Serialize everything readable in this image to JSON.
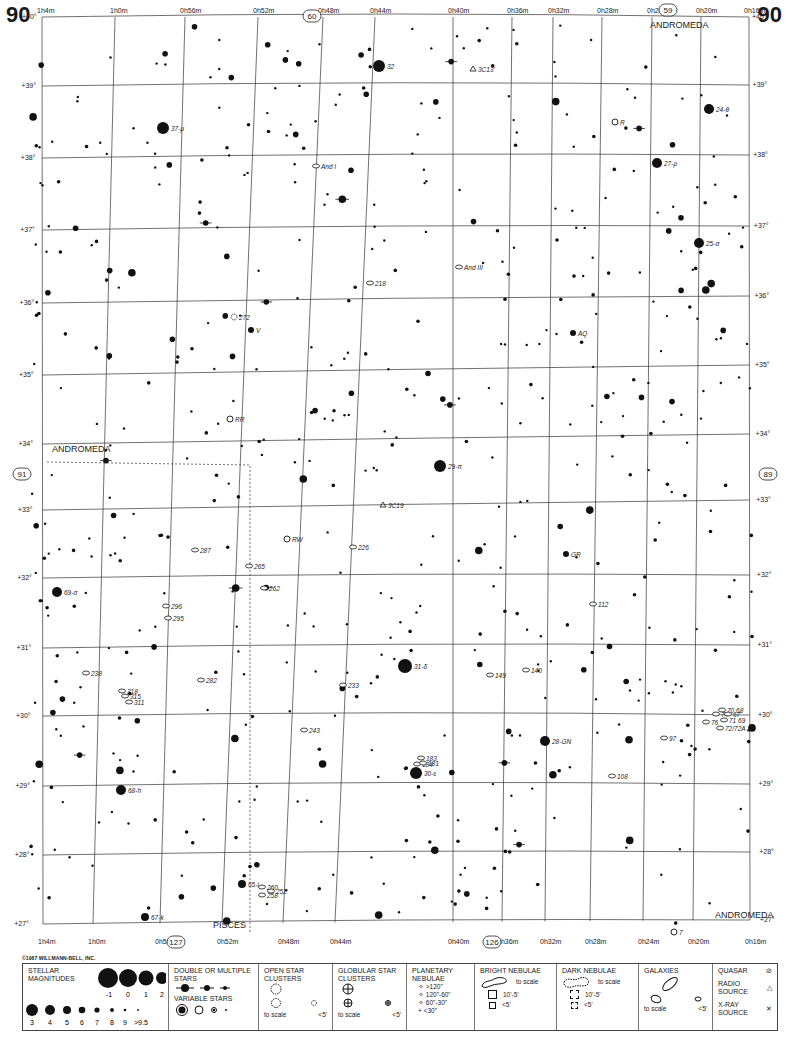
{
  "page": {
    "number_left": "90",
    "number_right": "90",
    "copyright": "©1987 WILLMANN-BELL, INC."
  },
  "adjacent_charts": {
    "top": "60",
    "top_right": "59",
    "left": "91",
    "right": "89",
    "bottom_left": "127",
    "bottom_right": "126"
  },
  "ra_labels_top": [
    "1h4m",
    "1h0m",
    "0h56m",
    "0h52m",
    "0h48m",
    "0h44m",
    "0h40m",
    "0h36m",
    "0h32m",
    "0h28m",
    "0h24m",
    "0h20m",
    "0h16m"
  ],
  "ra_labels_bottom": [
    "1h4m",
    "1h0m",
    "0h56m",
    "0h52m",
    "0h48m",
    "0h44m",
    "0h40m",
    "0h36m",
    "0h32m",
    "0h28m",
    "0h24m",
    "0h20m",
    "0h16m"
  ],
  "dec_labels": [
    "+40°",
    "+39°",
    "+38°",
    "+37°",
    "+36°",
    "+35°",
    "+34°",
    "+33°",
    "+32°",
    "+31°",
    "+30°",
    "+29°",
    "+28°",
    "+27°"
  ],
  "constellations": [
    {
      "name": "ANDROMEDA",
      "x": 650,
      "y": 28
    },
    {
      "name": "ANDROMEDA",
      "x": 52,
      "y": 452
    },
    {
      "name": "PISCES",
      "x": 213,
      "y": 928
    },
    {
      "name": "ANDROMEDA",
      "x": 715,
      "y": 918
    }
  ],
  "objects": [
    {
      "label": "32",
      "x": 379,
      "y": 66,
      "r": 6,
      "type": "star"
    },
    {
      "label": "3C13'",
      "x": 473,
      "y": 69,
      "type": "radio"
    },
    {
      "label": "37-μ",
      "x": 163,
      "y": 128,
      "r": 6,
      "type": "star"
    },
    {
      "label": "R",
      "x": 615,
      "y": 122,
      "type": "variable"
    },
    {
      "label": "24-θ",
      "x": 709,
      "y": 109,
      "r": 5,
      "type": "star"
    },
    {
      "label": "And I",
      "x": 316,
      "y": 166,
      "type": "galaxy"
    },
    {
      "label": "27-ρ",
      "x": 657,
      "y": 163,
      "r": 5,
      "type": "star"
    },
    {
      "label": "25-σ",
      "x": 699,
      "y": 243,
      "r": 5,
      "type": "star"
    },
    {
      "label": "And III",
      "x": 459,
      "y": 267,
      "type": "galaxy"
    },
    {
      "label": "218",
      "x": 370,
      "y": 283,
      "type": "galaxy"
    },
    {
      "label": "272",
      "x": 234,
      "y": 317,
      "type": "cluster"
    },
    {
      "label": "V",
      "x": 251,
      "y": 330,
      "type": "variable-small"
    },
    {
      "label": "AQ",
      "x": 573,
      "y": 333,
      "type": "variable-small"
    },
    {
      "label": "RR",
      "x": 230,
      "y": 419,
      "type": "variable"
    },
    {
      "label": "29-π",
      "x": 440,
      "y": 466,
      "r": 6,
      "type": "star"
    },
    {
      "label": "3C19",
      "x": 383,
      "y": 505,
      "type": "radio"
    },
    {
      "label": "287",
      "x": 195,
      "y": 550,
      "type": "galaxy"
    },
    {
      "label": "226",
      "x": 353,
      "y": 547,
      "type": "galaxy"
    },
    {
      "label": "RW",
      "x": 287,
      "y": 539,
      "type": "variable"
    },
    {
      "label": "GR",
      "x": 566,
      "y": 554,
      "type": "variable-small"
    },
    {
      "label": "265",
      "x": 249,
      "y": 566,
      "type": "galaxy"
    },
    {
      "label": "262",
      "x": 264,
      "y": 588,
      "type": "galaxy"
    },
    {
      "label": "69-σ",
      "x": 57,
      "y": 592,
      "r": 5,
      "type": "star"
    },
    {
      "label": "296",
      "x": 166,
      "y": 606,
      "type": "galaxy"
    },
    {
      "label": "295",
      "x": 168,
      "y": 618,
      "type": "galaxy"
    },
    {
      "label": "112",
      "x": 593,
      "y": 604,
      "type": "galaxy"
    },
    {
      "label": "31-δ",
      "x": 405,
      "y": 666,
      "r": 7,
      "type": "star"
    },
    {
      "label": "238",
      "x": 86,
      "y": 673,
      "type": "galaxy"
    },
    {
      "label": "282",
      "x": 201,
      "y": 680,
      "type": "galaxy"
    },
    {
      "label": "233",
      "x": 343,
      "y": 685,
      "type": "galaxy"
    },
    {
      "label": "149",
      "x": 490,
      "y": 675,
      "type": "galaxy"
    },
    {
      "label": "140",
      "x": 526,
      "y": 670,
      "type": "galaxy"
    },
    {
      "label": "318",
      "x": 122,
      "y": 691,
      "type": "galaxy"
    },
    {
      "label": "315",
      "x": 125,
      "y": 696,
      "type": "galaxy"
    },
    {
      "label": "311",
      "x": 129,
      "y": 702,
      "type": "galaxy"
    },
    {
      "label": "70 68",
      "x": 722,
      "y": 710,
      "type": "galaxy"
    },
    {
      "label": "74",
      "x": 716,
      "y": 714,
      "type": "galaxy"
    },
    {
      "label": "67",
      "x": 728,
      "y": 714,
      "type": "galaxy"
    },
    {
      "label": "71 69",
      "x": 724,
      "y": 720,
      "type": "galaxy"
    },
    {
      "label": "76",
      "x": 706,
      "y": 722,
      "type": "galaxy"
    },
    {
      "label": "72/72A",
      "x": 720,
      "y": 728,
      "type": "galaxy"
    },
    {
      "label": "243",
      "x": 304,
      "y": 730,
      "type": "galaxy"
    },
    {
      "label": "28-GN",
      "x": 545,
      "y": 741,
      "r": 5,
      "type": "star"
    },
    {
      "label": "97",
      "x": 664,
      "y": 738,
      "type": "galaxy"
    },
    {
      "label": "183",
      "x": 421,
      "y": 758,
      "type": "galaxy"
    },
    {
      "label": "184",
      "x": 417,
      "y": 764,
      "type": "galaxy"
    },
    {
      "label": "181",
      "x": 423,
      "y": 763,
      "type": "galaxy"
    },
    {
      "label": "30-ε",
      "x": 416,
      "y": 773,
      "r": 6,
      "type": "star"
    },
    {
      "label": "108",
      "x": 612,
      "y": 776,
      "type": "galaxy"
    },
    {
      "label": "68-h",
      "x": 121,
      "y": 790,
      "r": 5,
      "type": "star"
    },
    {
      "label": "65-i",
      "x": 242,
      "y": 884,
      "r": 4,
      "type": "star"
    },
    {
      "label": "260",
      "x": 262,
      "y": 887,
      "type": "galaxy"
    },
    {
      "label": "252",
      "x": 271,
      "y": 891,
      "type": "galaxy"
    },
    {
      "label": "258",
      "x": 262,
      "y": 895,
      "type": "galaxy"
    },
    {
      "label": "67-k",
      "x": 145,
      "y": 917,
      "r": 4,
      "type": "star"
    },
    {
      "label": "7",
      "x": 674,
      "y": 932,
      "type": "variable"
    }
  ],
  "legend": {
    "stellar_magnitudes": {
      "title": "STELLAR MAGNITUDES",
      "row1": [
        "-1",
        "0",
        "1",
        "2"
      ],
      "row2": [
        "3",
        "4",
        "5",
        "6",
        "7",
        "8",
        "9",
        ">9.5"
      ]
    },
    "double_stars": {
      "title": "DOUBLE OR MULTIPLE STARS"
    },
    "variable_stars": {
      "title": "VARIABLE STARS"
    },
    "open_clusters": {
      "title": "OPEN STAR CLUSTERS",
      "to_scale": "to scale",
      "small": "<5'"
    },
    "globular_clusters": {
      "title": "GLOBULAR STAR CLUSTERS",
      "to_scale": "to scale",
      "small": "<5'"
    },
    "planetary_nebulae": {
      "title": "PLANETARY NEBULAE",
      "sizes": [
        ">120\"",
        "120\"-60\"",
        "60\"-30\"",
        "<30\""
      ]
    },
    "bright_nebulae": {
      "title": "BRIGHT NEBULAE",
      "to_scale": "to scale",
      "mid": "10'-5'",
      "small": "<5'"
    },
    "dark_nebulae": {
      "title": "DARK NEBULAE",
      "to_scale": "to scale",
      "mid": "10'-5'",
      "small": "<5'"
    },
    "galaxies": {
      "title": "GALAXIES",
      "to_scale": "to scale",
      "small": "<5'"
    },
    "other": {
      "quasar": "QUASAR",
      "radio": "RADIO SOURCE",
      "xray": "X-RAY SOURCE"
    }
  }
}
